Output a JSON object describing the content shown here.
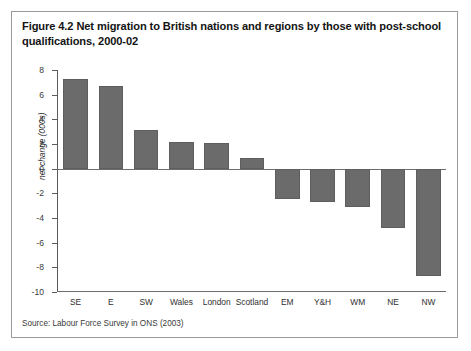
{
  "figure": {
    "title": "Figure 4.2 Net migration to British nations and regions by those with post-school qualifications, 2000-02",
    "source": "Source: Labour Force Survey in ONS (2003)",
    "frame_border_color": "#9a9a9a",
    "background_color": "#ffffff"
  },
  "chart_data": {
    "type": "bar",
    "title": "Figure 4.2 Net migration to British nations and regions by those with post-school qualifications, 2000-02",
    "xlabel": "",
    "ylabel": "net change (000s)",
    "categories": [
      "SE",
      "E",
      "SW",
      "Wales",
      "London",
      "Scotland",
      "EM",
      "Y&H",
      "WM",
      "NE",
      "NW"
    ],
    "values": [
      7.3,
      6.7,
      3.1,
      2.2,
      2.1,
      0.9,
      -2.5,
      -2.7,
      -3.1,
      -4.8,
      -8.7
    ],
    "ylim": [
      -10,
      8
    ],
    "ytick_step": 2,
    "yticks": [
      8,
      6,
      4,
      2,
      0,
      -2,
      -4,
      -6,
      -8,
      -10
    ],
    "ytick_labels": [
      "8",
      "6",
      "4",
      "2",
      "0",
      "-2",
      "-4",
      "-6",
      "-8",
      "-10"
    ],
    "grid": false,
    "legend": false,
    "bar_color": "#6b6b6b",
    "bar_edge_color": "#5e5e5e",
    "axis_color": "#5c5c5c",
    "zero_line": 0
  }
}
